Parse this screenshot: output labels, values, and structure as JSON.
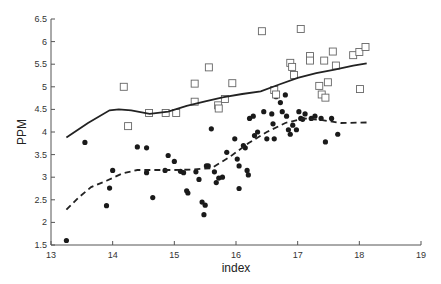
{
  "chart_data": {
    "type": "scatter",
    "title": "",
    "xlabel": "index",
    "ylabel": "PPM",
    "xlim": [
      13,
      19
    ],
    "ylim": [
      1.5,
      6.5
    ],
    "x_ticks": [
      13,
      14,
      15,
      16,
      17,
      18,
      19
    ],
    "y_ticks": [
      1.5,
      2,
      2.5,
      3,
      3.5,
      4,
      4.5,
      5,
      5.5,
      6,
      6.5
    ],
    "x_tick_labels": [
      "13",
      "14",
      "15",
      "16",
      "17",
      "18",
      "19"
    ],
    "y_tick_labels": [
      "1.5",
      "2",
      "2.5",
      "3",
      "3.5",
      "4",
      "4.5",
      "5",
      "5.5",
      "6",
      "6.5"
    ],
    "grid": false,
    "legend": null,
    "series": [
      {
        "name": "filled-circles",
        "marker": "circle-filled",
        "color": "#1a1a1a",
        "points": [
          [
            13.25,
            1.6
          ],
          [
            13.55,
            3.77
          ],
          [
            13.9,
            2.37
          ],
          [
            13.95,
            2.76
          ],
          [
            14.0,
            3.15
          ],
          [
            14.4,
            3.67
          ],
          [
            14.55,
            3.65
          ],
          [
            14.55,
            3.1
          ],
          [
            14.65,
            2.55
          ],
          [
            14.85,
            3.15
          ],
          [
            14.9,
            3.48
          ],
          [
            15.0,
            3.35
          ],
          [
            15.1,
            3.13
          ],
          [
            15.15,
            3.1
          ],
          [
            15.2,
            2.7
          ],
          [
            15.22,
            2.65
          ],
          [
            15.35,
            3.12
          ],
          [
            15.4,
            2.95
          ],
          [
            15.45,
            2.45
          ],
          [
            15.48,
            2.17
          ],
          [
            15.5,
            2.38
          ],
          [
            15.52,
            3.25
          ],
          [
            15.55,
            3.25
          ],
          [
            15.6,
            4.07
          ],
          [
            15.65,
            3.12
          ],
          [
            15.68,
            2.88
          ],
          [
            15.72,
            2.98
          ],
          [
            15.78,
            3.0
          ],
          [
            15.85,
            3.55
          ],
          [
            15.98,
            3.85
          ],
          [
            16.02,
            3.4
          ],
          [
            16.05,
            3.25
          ],
          [
            16.05,
            2.75
          ],
          [
            16.12,
            3.7
          ],
          [
            16.15,
            3.65
          ],
          [
            16.18,
            3.15
          ],
          [
            16.2,
            3.05
          ],
          [
            16.22,
            4.3
          ],
          [
            16.28,
            4.35
          ],
          [
            16.3,
            3.92
          ],
          [
            16.35,
            4.0
          ],
          [
            16.45,
            4.45
          ],
          [
            16.5,
            3.85
          ],
          [
            16.58,
            4.4
          ],
          [
            16.6,
            4.18
          ],
          [
            16.62,
            3.85
          ],
          [
            16.65,
            4.78
          ],
          [
            16.72,
            4.65
          ],
          [
            16.75,
            4.45
          ],
          [
            16.8,
            4.82
          ],
          [
            16.82,
            4.35
          ],
          [
            16.85,
            4.05
          ],
          [
            16.88,
            3.95
          ],
          [
            16.92,
            4.15
          ],
          [
            16.98,
            4.05
          ],
          [
            17.02,
            4.45
          ],
          [
            17.05,
            4.3
          ],
          [
            17.08,
            4.28
          ],
          [
            17.12,
            4.4
          ],
          [
            17.22,
            4.3
          ],
          [
            17.28,
            4.35
          ],
          [
            17.38,
            4.3
          ],
          [
            17.45,
            3.78
          ],
          [
            17.55,
            4.3
          ],
          [
            17.65,
            3.95
          ]
        ]
      },
      {
        "name": "open-squares",
        "marker": "square-open",
        "color": "#666666",
        "points": [
          [
            14.18,
            5.0
          ],
          [
            14.25,
            4.13
          ],
          [
            14.59,
            4.42
          ],
          [
            14.86,
            4.42
          ],
          [
            15.03,
            4.42
          ],
          [
            15.33,
            5.07
          ],
          [
            15.33,
            4.67
          ],
          [
            15.56,
            5.43
          ],
          [
            15.71,
            4.59
          ],
          [
            15.72,
            4.52
          ],
          [
            15.82,
            4.73
          ],
          [
            15.94,
            5.08
          ],
          [
            16.42,
            6.23
          ],
          [
            16.62,
            4.93
          ],
          [
            16.65,
            4.83
          ],
          [
            16.88,
            5.53
          ],
          [
            16.91,
            5.44
          ],
          [
            16.94,
            5.26
          ],
          [
            17.05,
            6.28
          ],
          [
            17.2,
            5.68
          ],
          [
            17.2,
            5.58
          ],
          [
            17.35,
            5.02
          ],
          [
            17.39,
            4.83
          ],
          [
            17.43,
            5.58
          ],
          [
            17.45,
            4.76
          ],
          [
            17.49,
            5.1
          ],
          [
            17.57,
            5.78
          ],
          [
            17.62,
            5.47
          ],
          [
            17.9,
            5.7
          ],
          [
            18.0,
            5.77
          ],
          [
            18.01,
            4.95
          ],
          [
            18.1,
            5.88
          ]
        ]
      },
      {
        "name": "upper-trend",
        "marker": "line-solid",
        "color": "#222222",
        "points": [
          [
            13.25,
            3.88
          ],
          [
            13.6,
            4.2
          ],
          [
            13.95,
            4.48
          ],
          [
            14.1,
            4.5
          ],
          [
            14.3,
            4.48
          ],
          [
            14.6,
            4.4
          ],
          [
            14.9,
            4.45
          ],
          [
            15.2,
            4.58
          ],
          [
            15.5,
            4.68
          ],
          [
            15.8,
            4.77
          ],
          [
            16.1,
            4.84
          ],
          [
            16.4,
            4.9
          ],
          [
            16.7,
            5.05
          ],
          [
            17.0,
            5.2
          ],
          [
            17.3,
            5.3
          ],
          [
            17.6,
            5.38
          ],
          [
            17.9,
            5.47
          ],
          [
            18.12,
            5.52
          ]
        ]
      },
      {
        "name": "lower-trend",
        "marker": "line-dashed",
        "color": "#222222",
        "points": [
          [
            13.25,
            2.28
          ],
          [
            13.45,
            2.55
          ],
          [
            13.65,
            2.78
          ],
          [
            13.9,
            2.92
          ],
          [
            14.15,
            3.08
          ],
          [
            14.4,
            3.16
          ],
          [
            14.7,
            3.16
          ],
          [
            15.0,
            3.16
          ],
          [
            15.3,
            3.17
          ],
          [
            15.6,
            3.2
          ],
          [
            15.9,
            3.45
          ],
          [
            16.2,
            3.75
          ],
          [
            16.5,
            4.0
          ],
          [
            16.8,
            4.2
          ],
          [
            17.1,
            4.3
          ],
          [
            17.4,
            4.26
          ],
          [
            17.7,
            4.2
          ],
          [
            18.12,
            4.21
          ]
        ]
      }
    ]
  },
  "axes": {
    "xlabel": "index",
    "ylabel": "PPM"
  }
}
